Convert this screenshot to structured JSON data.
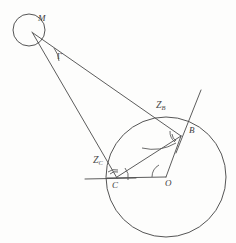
{
  "figure": {
    "type": "geometry-diagram",
    "background_color": "#fdfdfc",
    "stroke_color": "#4a4a4a",
    "width": 236,
    "height": 243
  },
  "points": {
    "m": {
      "label": "M",
      "x": 38,
      "y": 19
    },
    "b": {
      "label": "B",
      "x": 189,
      "y": 131
    },
    "c": {
      "label": "C",
      "x": 114,
      "y": 186
    },
    "o": {
      "label": "O",
      "x": 167,
      "y": 184
    }
  },
  "angles": {
    "gamma": {
      "label": "Γ",
      "x": 58,
      "y": 54
    },
    "at_b": {
      "base": "Z",
      "sub": "B",
      "x": 158,
      "y": 104
    },
    "at_c": {
      "base": "Z",
      "sub": "C",
      "x": 95,
      "y": 159
    }
  },
  "shapes": {
    "small_circle": {
      "cx": 29,
      "cy": 30,
      "r": 16
    },
    "large_circle": {
      "cx": 166,
      "cy": 177,
      "r": 60
    }
  }
}
